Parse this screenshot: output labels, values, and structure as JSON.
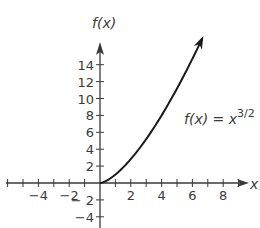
{
  "chart_data": {
    "type": "line",
    "title": "",
    "xlabel": "x",
    "ylabel": "f(x)",
    "x_ticks": [
      -4,
      -2,
      2,
      4,
      6,
      8
    ],
    "y_ticks": [
      -4,
      -2,
      2,
      4,
      6,
      8,
      10,
      12,
      14
    ],
    "x_tick_labels": [
      "−4",
      "−2",
      "2",
      "4",
      "6",
      "8"
    ],
    "y_tick_labels": [
      "−4",
      "− 2",
      "2",
      "4",
      "6",
      "8",
      "10",
      "12",
      "14"
    ],
    "xlim": [
      -6,
      9.5
    ],
    "ylim": [
      -5,
      16
    ],
    "grid": false,
    "series": [
      {
        "name": "f(x) = x^3/2",
        "function": "x^(3/2)",
        "x": [
          0,
          1,
          2,
          3,
          4,
          5,
          6,
          6.6
        ],
        "values": [
          0,
          1,
          2.83,
          5.2,
          8,
          11.18,
          14.7,
          16.96
        ],
        "arrow_at_end": true
      }
    ],
    "annotations": [
      {
        "text": "f(x) = x",
        "superscript": "3/2"
      }
    ]
  },
  "labels": {
    "y_axis": "f(x)",
    "x_axis": "x",
    "curve_main": "f(x) = x",
    "curve_exp": "3/2"
  }
}
